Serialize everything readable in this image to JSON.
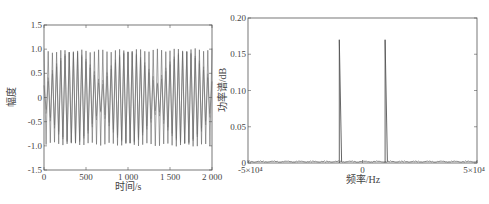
{
  "chart_data": [
    {
      "type": "line",
      "title": "",
      "xlabel": "时间/s",
      "ylabel": "幅度",
      "xlim": [
        0,
        2000
      ],
      "ylim": [
        -1.5,
        1.5
      ],
      "xticks": [
        0,
        500,
        1000,
        1500,
        2000
      ],
      "xtick_labels": [
        "0",
        "500",
        "1 000",
        "1 500",
        "2 000"
      ],
      "yticks": [
        -1.5,
        -1.0,
        -0.5,
        0,
        0.5,
        1.0,
        1.5
      ],
      "ytick_labels": [
        "-1.5",
        "-1.0",
        "-0.5",
        "0",
        "0.5",
        "1.0",
        "1.5"
      ],
      "grid": false,
      "description": "Sinusoid of amplitude 1.0 sampled over 0-2000 s, about 40 visible cycles with aliasing moire pattern",
      "series": [
        {
          "name": "signal",
          "amplitude": 1.0,
          "cycles": 40,
          "x_range": [
            0,
            2000
          ]
        }
      ]
    },
    {
      "type": "line",
      "title": "",
      "xlabel": "频率/Hz",
      "ylabel": "功率谱/dB",
      "xlim": [
        -50000,
        50000
      ],
      "ylim": [
        0,
        0.2
      ],
      "xticks": [
        -50000,
        0,
        50000
      ],
      "xtick_labels": [
        "-5×10⁴",
        "0",
        "5×10⁴"
      ],
      "yticks": [
        0,
        0.05,
        0.1,
        0.15,
        0.2
      ],
      "ytick_labels": [
        "0",
        "0.05",
        "0.10",
        "0.15",
        "0.20"
      ],
      "grid": false,
      "series": [
        {
          "name": "power spectrum",
          "peaks": [
            {
              "x": -10000,
              "y": 0.17
            },
            {
              "x": 10000,
              "y": 0.17
            }
          ],
          "noise_floor": 0.003
        }
      ]
    }
  ],
  "left_plot": {
    "ylabel": "幅度",
    "xlabel": "时间/s",
    "yticks": [
      "1.5",
      "1.0",
      "0.5",
      "0",
      "-0.5",
      "-1.0",
      "-1.5"
    ],
    "xticks": [
      "0",
      "500",
      "1 000",
      "1 500",
      "2 000"
    ]
  },
  "right_plot": {
    "ylabel": "功率谱/dB",
    "xlabel": "频率/Hz",
    "yticks": [
      "0.20",
      "0.15",
      "0.10",
      "0.05",
      "0"
    ],
    "xticks": [
      "-5×10⁴",
      "0",
      "5×10⁴"
    ]
  }
}
